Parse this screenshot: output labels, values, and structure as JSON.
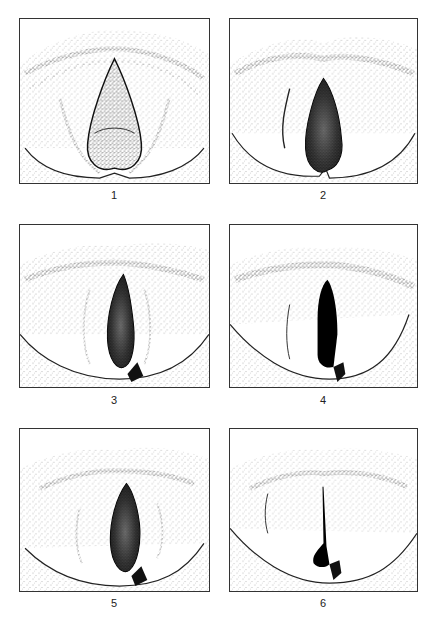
{
  "figure": {
    "panels": [
      {
        "label": "1",
        "glottis": "wide-open triangular",
        "fill": "stippled"
      },
      {
        "label": "2",
        "glottis": "open elliptical",
        "fill": "dark stippled"
      },
      {
        "label": "3",
        "glottis": "narrow elliptical",
        "fill": "dark stippled"
      },
      {
        "label": "4",
        "glottis": "narrow slit",
        "fill": "solid black"
      },
      {
        "label": "5",
        "glottis": "spindle-shaped",
        "fill": "dark stippled"
      },
      {
        "label": "6",
        "glottis": "closed, posterior chink",
        "fill": "solid black"
      }
    ]
  },
  "colors": {
    "ink": "#111111",
    "border": "#333333",
    "background": "#ffffff"
  }
}
